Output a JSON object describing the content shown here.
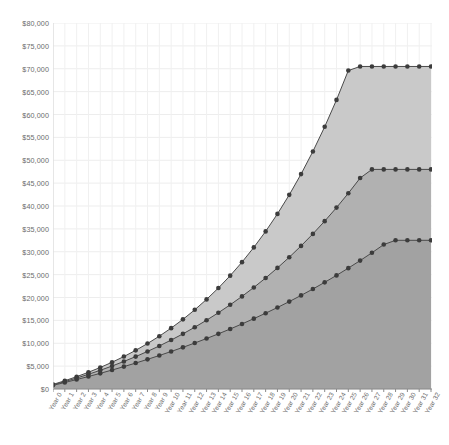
{
  "chart_data": {
    "type": "area",
    "title": "",
    "subtitle": "",
    "xlabel": "",
    "ylabel": "",
    "grid": true,
    "legend_position": "none",
    "ylim": [
      0,
      80000
    ],
    "ytick_values": [
      0,
      5000,
      10000,
      15000,
      20000,
      25000,
      30000,
      35000,
      40000,
      45000,
      50000,
      55000,
      60000,
      65000,
      70000,
      75000,
      80000
    ],
    "ytick_labels": [
      "$0",
      "$5,000",
      "$10,000",
      "$15,000",
      "$20,000",
      "$25,000",
      "$30,000",
      "$35,000",
      "$40,000",
      "$45,000",
      "$50,000",
      "$55,000",
      "$60,000",
      "$65,000",
      "$70,000",
      "$75,000",
      "$80,000"
    ],
    "categories": [
      "Year 0",
      "Year 1",
      "Year 2",
      "Year 3",
      "Year 4",
      "Year 5",
      "Year 6",
      "Year 7",
      "Year 8",
      "Year 9",
      "Year 10",
      "Year 11",
      "Year 12",
      "Year 13",
      "Year 14",
      "Year 15",
      "Year 16",
      "Year 17",
      "Year 18",
      "Year 19",
      "Year 20",
      "Year 21",
      "Year 22",
      "Year 23",
      "Year 24",
      "Year 25",
      "Year 26",
      "Year 27",
      "Year 28",
      "Year 29",
      "Year 30",
      "Year 31",
      "Year 32"
    ],
    "series": [
      {
        "name": "High growth",
        "color": "#c9c9c9",
        "line_color": "#4a4a4a",
        "marker": "circle",
        "values": [
          1000,
          1810,
          2693,
          3655,
          4704,
          5847,
          7093,
          8451,
          9932,
          11546,
          13305,
          15222,
          17312,
          19590,
          22073,
          24779,
          27730,
          30946,
          34451,
          38272,
          42437,
          46976,
          51924,
          57317,
          63196,
          69604,
          70500,
          70500,
          70500,
          70500,
          70500,
          70500,
          70500
        ]
      },
      {
        "name": "Medium growth",
        "color": "#b1b1b1",
        "line_color": "#4a4a4a",
        "marker": "circle",
        "values": [
          900,
          1620,
          2390,
          3211,
          4088,
          5023,
          6020,
          7082,
          8212,
          9415,
          10694,
          12055,
          13501,
          15037,
          16669,
          18402,
          20242,
          22195,
          24268,
          26467,
          28801,
          31277,
          33903,
          36690,
          39646,
          42782,
          46108,
          48000,
          48000,
          48000,
          48000,
          48000,
          48000
        ]
      },
      {
        "name": "Low growth",
        "color": "#a2a2a2",
        "line_color": "#4a4a4a",
        "marker": "circle",
        "values": [
          800,
          1420,
          2063,
          2731,
          3425,
          4145,
          4894,
          5672,
          6481,
          7322,
          8196,
          9105,
          10050,
          11033,
          12055,
          13118,
          14224,
          15374,
          16570,
          17814,
          19108,
          20455,
          21857,
          23316,
          24835,
          26417,
          28065,
          29781,
          31569,
          32500,
          32500,
          32500,
          32500
        ]
      }
    ]
  }
}
